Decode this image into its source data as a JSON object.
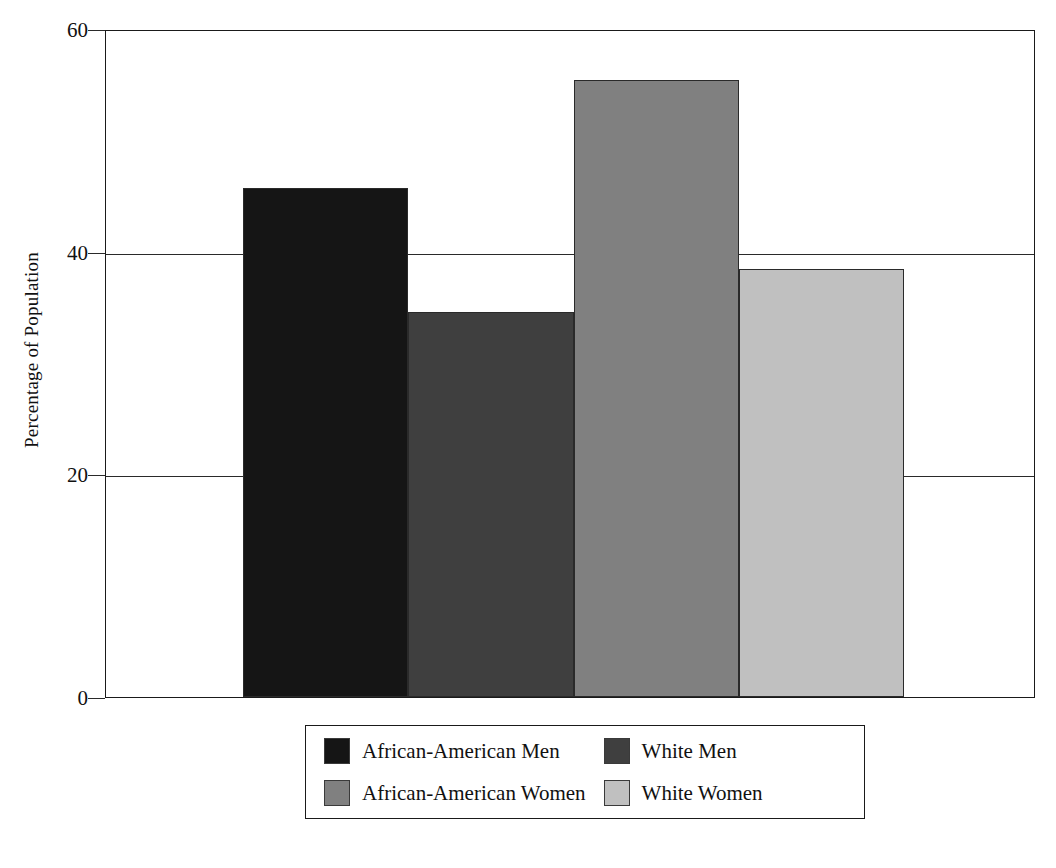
{
  "chart_data": {
    "type": "bar",
    "title": "",
    "xlabel": "",
    "ylabel": "Percentage of Population",
    "ylim": [
      0,
      60
    ],
    "yticks": [
      0,
      20,
      40,
      60
    ],
    "ytick_labels": [
      "0",
      "20",
      "40",
      "60"
    ],
    "grid": "horizontal",
    "gridlines_at": [
      20,
      40,
      60
    ],
    "legend_position": "below-center",
    "legend_columns": 2,
    "categories": [
      "African-American Men",
      "White Men",
      "African-American Women",
      "White Women"
    ],
    "values": [
      45.7,
      34.6,
      55.4,
      38.4
    ],
    "bar_colors": [
      "#151515",
      "#3f3f3f",
      "#808080",
      "#c0c0c0"
    ],
    "bar_edge_color": "#2a2a2a",
    "bars": [
      {
        "label": "African-American Men",
        "value": 45.7,
        "color": "#151515"
      },
      {
        "label": "White Men",
        "value": 34.6,
        "color": "#3f3f3f"
      },
      {
        "label": "African-American Women",
        "value": 55.4,
        "color": "#808080"
      },
      {
        "label": "White Women",
        "value": 38.4,
        "color": "#c0c0c0"
      }
    ],
    "legend": [
      {
        "label": "African-American Men",
        "color": "#151515"
      },
      {
        "label": "White Men",
        "color": "#3f3f3f"
      },
      {
        "label": "African-American Women",
        "color": "#808080"
      },
      {
        "label": "White Women",
        "color": "#c0c0c0"
      }
    ]
  },
  "axis": {
    "y_title": "Percentage of Population"
  }
}
